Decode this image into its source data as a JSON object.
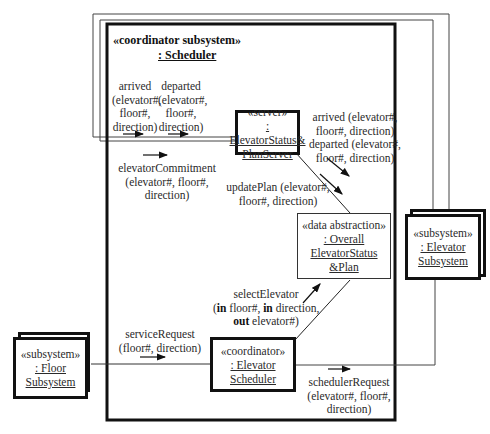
{
  "container": {
    "stereotype": "«coordinator subsystem»",
    "name": ": Scheduler"
  },
  "objects": {
    "server": {
      "stereotype": "«server»",
      "name_line1": ": ElevatorStatus&",
      "name_line2": "PlanServer"
    },
    "data_abstraction": {
      "stereotype": "«data abstraction»",
      "name_line1": ": Overall",
      "name_line2": "ElevatorStatus",
      "name_line3": "&Plan"
    },
    "coordinator": {
      "stereotype": "«coordinator»",
      "name_line1": ": Elevator",
      "name_line2": "Scheduler"
    },
    "floor_subsystem": {
      "stereotype": "«subsystem»",
      "name_line1": ": Floor",
      "name_line2": "Subsystem"
    },
    "elevator_subsystem": {
      "stereotype": "«subsystem»",
      "name_line1": ": Elevator",
      "name_line2": "Subsystem"
    }
  },
  "messages": {
    "arrived_left": [
      "arrived",
      "(elevator#,",
      "floor#,",
      "direction)"
    ],
    "departed_left": [
      "departed",
      "(elevator#,",
      "floor#,",
      "direction)"
    ],
    "elevator_commitment": [
      "elevatorCommitment",
      "(elevator#, floor#,",
      "direction)"
    ],
    "arrived_departed_right": [
      "arrived (elevator#,",
      "floor#, direction)",
      "departed (elevator#,",
      "floor#, direction)"
    ],
    "update_plan": [
      "updatePlan (elevator#,",
      "floor#, direction)"
    ],
    "select_elevator": {
      "line1": "selectElevator",
      "line2_kw": "in",
      "line2_pre": "(",
      "line2_a": " floor#, ",
      "line2_kw2": "in",
      "line2_b": " direction,",
      "line3_kw": "out",
      "line3_b": " elevator#)"
    },
    "service_request": [
      "serviceRequest",
      "(floor#, direction)"
    ],
    "scheduler_request": [
      "schedulerRequest",
      "(elevator#, floor#,",
      "direction)"
    ]
  }
}
